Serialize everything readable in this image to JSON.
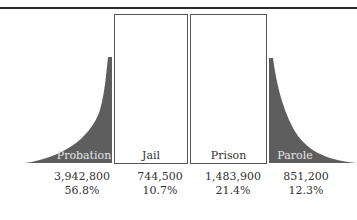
{
  "figure": {
    "categories": [
      {
        "label": "Probation",
        "count": "3,942,800",
        "percent": "56.8%",
        "style": "curve-left"
      },
      {
        "label": "Jail",
        "count": "744,500",
        "percent": "10.7%",
        "style": "box"
      },
      {
        "label": "Prison",
        "count": "1,483,900",
        "percent": "21.4%",
        "style": "box"
      },
      {
        "label": "Parole",
        "count": "851,200",
        "percent": "12.3%",
        "style": "curve-right"
      }
    ],
    "colors": {
      "fill": "#5e5e5e",
      "border": "#555555",
      "rule": "#2a2a2a"
    }
  }
}
